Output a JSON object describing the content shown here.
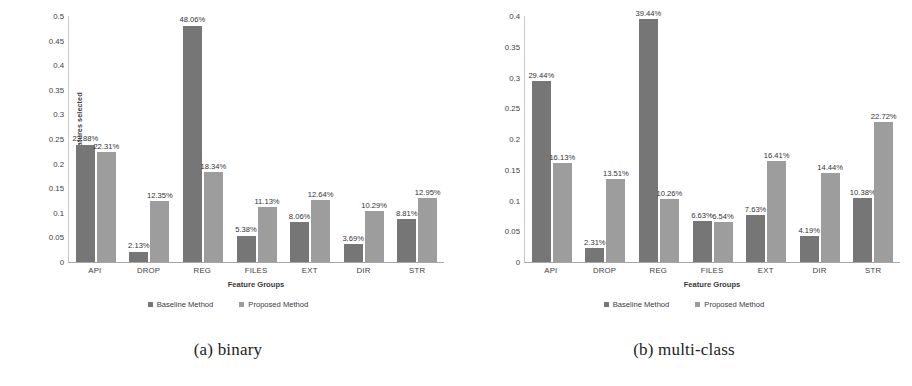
{
  "figure": {
    "panels": [
      {
        "caption": "(a) binary",
        "legend": {
          "baseline_label": "Baseline Method",
          "proposed_label": "Proposed Method"
        },
        "chart_data": {
          "type": "bar",
          "title": "",
          "xlabel": "Feature Groups",
          "ylabel": "Percentage of features selected",
          "categories": [
            "API",
            "DROP",
            "REG",
            "FILES",
            "EXT",
            "DIR",
            "STR"
          ],
          "ylim": [
            0,
            0.5
          ],
          "yticks": [
            "0",
            "0.05",
            "0.1",
            "0.15",
            "0.2",
            "0.25",
            "0.3",
            "0.35",
            "0.4",
            "0.45",
            "0.5"
          ],
          "grid": false,
          "legend_position": "bottom-center",
          "series": [
            {
              "name": "Baseline Method",
              "color": "#767676",
              "values": [
                0.2388,
                0.0213,
                0.4806,
                0.0538,
                0.0806,
                0.0369,
                0.0881
              ],
              "labels": [
                "23.88%",
                "2.13%",
                "48.06%",
                "5.38%",
                "8.06%",
                "3.69%",
                "8.81%"
              ]
            },
            {
              "name": "Proposed Method",
              "color": "#9d9d9d",
              "values": [
                0.2231,
                0.1235,
                0.1834,
                0.1113,
                0.1264,
                0.1029,
                0.1295
              ],
              "labels": [
                "22.31%",
                "12.35%",
                "18.34%",
                "11.13%",
                "12.64%",
                "10.29%",
                "12.95%"
              ]
            }
          ]
        }
      },
      {
        "caption": "(b) multi-class",
        "legend": {
          "baseline_label": "Baseline Method",
          "proposed_label": "Proposed Method"
        },
        "chart_data": {
          "type": "bar",
          "title": "",
          "xlabel": "Feature Groups",
          "ylabel": "Percentage of features selected",
          "categories": [
            "API",
            "DROP",
            "REG",
            "FILES",
            "EXT",
            "DIR",
            "STR"
          ],
          "ylim": [
            0,
            0.4
          ],
          "yticks": [
            "0",
            "0.05",
            "0.1",
            "0.15",
            "0.2",
            "0.25",
            "0.3",
            "0.35",
            "0.4"
          ],
          "grid": false,
          "legend_position": "bottom-center",
          "series": [
            {
              "name": "Baseline Method",
              "color": "#767676",
              "values": [
                0.2944,
                0.0231,
                0.3944,
                0.0663,
                0.0763,
                0.0419,
                0.1038
              ],
              "labels": [
                "29.44%",
                "2.31%",
                "39.44%",
                "6.63%",
                "7.63%",
                "4.19%",
                "10.38%"
              ]
            },
            {
              "name": "Proposed Method",
              "color": "#9d9d9d",
              "values": [
                0.1613,
                0.1351,
                0.1026,
                0.0654,
                0.1641,
                0.1444,
                0.2272
              ],
              "labels": [
                "16.13%",
                "13.51%",
                "10.26%",
                "6.54%",
                "16.41%",
                "14.44%",
                "22.72%"
              ]
            }
          ]
        }
      }
    ]
  }
}
